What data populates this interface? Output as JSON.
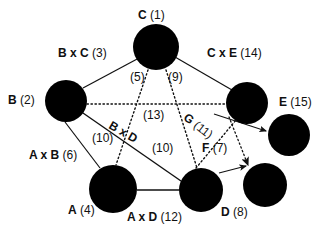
{
  "figure": {
    "background_color": "#ffffff",
    "node_color": "#000000",
    "edge_color": "#1a1a1a"
  },
  "nodes": [
    {
      "id": "C",
      "label_name": "C",
      "label_number": "(1)",
      "cx": 156,
      "cy": 47,
      "r": 23
    },
    {
      "id": "B",
      "label_name": "B",
      "label_number": "(2)",
      "cx": 66,
      "cy": 101,
      "r": 21
    },
    {
      "id": "E",
      "label_name": "E",
      "label_number": "(15)",
      "cx": 247,
      "cy": 103,
      "r": 21
    },
    {
      "id": "N1",
      "label_name": "",
      "label_number": "",
      "cx": 289,
      "cy": 135,
      "r": 21
    },
    {
      "id": "A",
      "label_name": "A",
      "label_number": "(4)",
      "cx": 113,
      "cy": 189,
      "r": 24
    },
    {
      "id": "D",
      "label_name": "D",
      "label_number": "(8)",
      "cx": 201,
      "cy": 190,
      "r": 22
    },
    {
      "id": "N2",
      "label_name": "",
      "label_number": "",
      "cx": 265,
      "cy": 185,
      "r": 22
    }
  ],
  "node_labels": [
    {
      "key": "c",
      "name": "C",
      "number": "(1)",
      "x": 138,
      "y": 9
    },
    {
      "key": "b",
      "name": "B",
      "number": "(2)",
      "x": 8,
      "y": 94
    },
    {
      "key": "e",
      "name": "E",
      "number": "(15)",
      "x": 279,
      "y": 96
    },
    {
      "key": "a",
      "name": "A",
      "number": "(4)",
      "x": 68,
      "y": 204
    },
    {
      "key": "d",
      "name": "D",
      "number": "(8)",
      "x": 221,
      "y": 206
    }
  ],
  "edge_labels": [
    {
      "key": "bxc",
      "name": "B x C",
      "number": "(3)",
      "x": 58,
      "y": 47,
      "rot": "none"
    },
    {
      "key": "cxe",
      "name": "C x E",
      "number": "(14)",
      "x": 207,
      "y": 47,
      "rot": "none"
    },
    {
      "key": "five",
      "name": "",
      "number": "(5)",
      "x": 130,
      "y": 71,
      "rot": "none"
    },
    {
      "key": "nine",
      "name": "",
      "number": "(9)",
      "x": 168,
      "y": 71,
      "rot": "none"
    },
    {
      "key": "thir",
      "name": "",
      "number": "(13)",
      "x": 143,
      "y": 109,
      "rot": "none"
    },
    {
      "key": "g11",
      "name": "G",
      "number": "(11)",
      "x": 189,
      "y": 111,
      "rot": "g11"
    },
    {
      "key": "ten_a",
      "name": "",
      "number": "(10)",
      "x": 92,
      "y": 132,
      "rot": "none"
    },
    {
      "key": "bxd",
      "name": "B x D",
      "number": "",
      "x": 113,
      "y": 119,
      "rot": "bxd"
    },
    {
      "key": "ten_b",
      "name": "",
      "number": "(10)",
      "x": 152,
      "y": 142,
      "rot": "none"
    },
    {
      "key": "axb",
      "name": "A x B",
      "number": "(6)",
      "x": 29,
      "y": 149,
      "rot": "none"
    },
    {
      "key": "f7",
      "name": "F",
      "number": "(7)",
      "x": 202,
      "y": 142,
      "rot": "none"
    },
    {
      "key": "axd",
      "name": "A x D",
      "number": "(12)",
      "x": 127,
      "y": 211,
      "rot": "none"
    }
  ],
  "edges": [
    {
      "from": "B",
      "to": "C",
      "style": "solid",
      "arrow": false,
      "label": "B x C (3)"
    },
    {
      "from": "C",
      "to": "E",
      "style": "solid",
      "arrow": false,
      "label": "C x E (14)"
    },
    {
      "from": "B",
      "to": "A",
      "style": "solid",
      "arrow": false,
      "label": "A x B (6)"
    },
    {
      "from": "B",
      "to": "D",
      "style": "solid",
      "arrow": false,
      "label": "B x D (10)"
    },
    {
      "from": "A",
      "to": "D",
      "style": "solid",
      "arrow": false,
      "label": "A x D (12)"
    },
    {
      "from": "B",
      "to": "E",
      "style": "dotted",
      "arrow": false,
      "label": "(13)"
    },
    {
      "from": "C",
      "to": "A",
      "style": "dotted",
      "arrow": false,
      "label": "(5)"
    },
    {
      "from": "C",
      "to": "D",
      "style": "dotted",
      "arrow": false,
      "label": "(9)"
    },
    {
      "from": "E",
      "to": "N1",
      "style": "solid",
      "arrow": true,
      "label": "G (11)"
    },
    {
      "from": "E",
      "to": "N2",
      "style": "dotted",
      "arrow": true,
      "label": "F (7)"
    },
    {
      "from": "D",
      "to": "N2",
      "style": "dotted",
      "arrow": true,
      "label": "F (7)"
    },
    {
      "from": "D",
      "to": "E",
      "style": "dotted",
      "arrow": false,
      "label": "G (11)"
    }
  ]
}
